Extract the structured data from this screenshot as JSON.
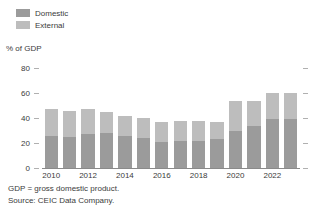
{
  "legend": {
    "items": [
      {
        "label": "Domestic",
        "color": "#9b9b9b",
        "swatch_name": "legend-swatch-domestic"
      },
      {
        "label": "External",
        "color": "#bdbdbd",
        "swatch_name": "legend-swatch-external"
      }
    ]
  },
  "axis_title": "% of GDP",
  "footnotes": [
    "GDP = gross domestic product.",
    "Source: CEIC Data Company."
  ],
  "chart_data": {
    "type": "bar",
    "stacked": true,
    "title": "",
    "subtitle": "",
    "xlabel": "",
    "ylabel": "% of GDP",
    "ylim": [
      0,
      80
    ],
    "yticks": [
      0,
      20,
      40,
      60,
      80
    ],
    "ytick_labels": [
      "0",
      "20",
      "40",
      "60",
      "80"
    ],
    "grid": false,
    "legend_position": "top-left",
    "x": [
      2010,
      2011,
      2012,
      2013,
      2014,
      2015,
      2016,
      2017,
      2018,
      2019,
      2020,
      2021,
      2022,
      2023
    ],
    "categories": [
      "2010",
      "2011",
      "2012",
      "2013",
      "2014",
      "2015",
      "2016",
      "2017",
      "2018",
      "2019",
      "2020",
      "2021",
      "2022",
      "2023"
    ],
    "xtick_labels": [
      "2010",
      "2012",
      "2014",
      "2016",
      "2018",
      "2020",
      "2022"
    ],
    "xticks": [
      2010,
      2012,
      2014,
      2016,
      2018,
      2020,
      2022
    ],
    "series": [
      {
        "name": "Domestic",
        "color": "#9b9b9b",
        "values": [
          26,
          25,
          27,
          28,
          26,
          24,
          21,
          22,
          22,
          23,
          30,
          34,
          39,
          39
        ]
      },
      {
        "name": "External",
        "color": "#bdbdbd",
        "values": [
          21,
          21,
          20,
          17,
          16,
          16,
          16,
          16,
          16,
          14,
          24,
          20,
          21,
          21
        ]
      }
    ],
    "totals": [
      47,
      46,
      47,
      45,
      42,
      40,
      37,
      38,
      38,
      37,
      54,
      54,
      60,
      60
    ]
  }
}
